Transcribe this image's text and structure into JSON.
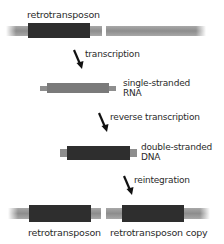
{
  "diagram": {
    "top_label": "retrotransposon",
    "steps": [
      {
        "arrow_label": "transcription",
        "product_label_line1": "single-stranded",
        "product_label_line2": "RNA"
      },
      {
        "arrow_label": "reverse transcription",
        "product_label_line1": "double-stranded",
        "product_label_line2": "DNA"
      },
      {
        "arrow_label": "reintegration"
      }
    ],
    "bottom_labels": {
      "original": "retrotransposon",
      "copy": "retrotransposon copy"
    },
    "colors": {
      "genomic_dna": "#9a9a9a",
      "retrotransposon": "#2e2e2e",
      "rna": "#7a7a7a",
      "flank": "#8e8e8e",
      "arrow": "#111111"
    }
  }
}
